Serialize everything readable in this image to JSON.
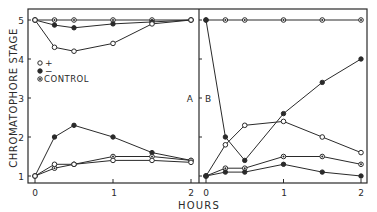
{
  "chart_data": [
    {
      "type": "line",
      "panel": "A",
      "title": "",
      "xlabel": "HOURS",
      "ylabel": "CHROMATOPHORE STAGE",
      "xlim": [
        0,
        2
      ],
      "ylim": [
        1,
        5
      ],
      "x_ticks": [
        "0",
        "1",
        "2"
      ],
      "y_ticks": [
        "1",
        "2",
        "3",
        "4",
        "5"
      ],
      "grid": false,
      "legend": {
        "position": "upper-left-inside",
        "entries": [
          {
            "marker": "open-circle",
            "label": "+"
          },
          {
            "marker": "filled-circle",
            "label": "−"
          },
          {
            "marker": "half-filled-circle",
            "label": "CONTROL"
          }
        ]
      },
      "x": [
        0,
        0.25,
        0.5,
        1,
        1.5,
        2
      ],
      "series": [
        {
          "name": "CONTROL (upper)",
          "marker": "half",
          "values": [
            5.0,
            5.0,
            5.0,
            5.0,
            5.0,
            5.0
          ]
        },
        {
          "name": "− (upper)",
          "marker": "filled",
          "values": [
            5.0,
            4.87,
            4.8,
            4.9,
            4.95,
            5.0
          ]
        },
        {
          "name": "+ (upper)",
          "marker": "open",
          "values": [
            5.0,
            4.3,
            4.2,
            4.4,
            4.9,
            5.0
          ]
        },
        {
          "name": "− (lower)",
          "marker": "filled",
          "values": [
            1.0,
            2.0,
            2.3,
            2.0,
            1.6,
            1.4
          ]
        },
        {
          "name": "CONTROL (lower)",
          "marker": "half",
          "values": [
            1.0,
            1.2,
            1.3,
            1.5,
            1.5,
            1.4
          ]
        },
        {
          "name": "+ (lower)",
          "marker": "open",
          "values": [
            1.0,
            1.3,
            1.3,
            1.4,
            1.4,
            1.35
          ]
        }
      ]
    },
    {
      "type": "line",
      "panel": "B",
      "title": "",
      "xlabel": "HOURS",
      "ylabel": "CHROMATOPHORE STAGE",
      "xlim": [
        0,
        2
      ],
      "ylim": [
        1,
        5
      ],
      "x_ticks": [
        "0",
        "1",
        "2"
      ],
      "grid": false,
      "x": [
        0,
        0.25,
        0.5,
        1,
        1.5,
        2
      ],
      "series": [
        {
          "name": "CONTROL (upper)",
          "marker": "half",
          "values": [
            5.0,
            5.0,
            5.0,
            5.0,
            5.0,
            5.0
          ]
        },
        {
          "name": "− (from 5)",
          "marker": "filled",
          "values": [
            5.0,
            2.0,
            1.4,
            2.6,
            3.4,
            4.0
          ]
        },
        {
          "name": "+ (from 1)",
          "marker": "open",
          "values": [
            1.0,
            1.8,
            2.3,
            2.4,
            2.0,
            1.6
          ]
        },
        {
          "name": "CONTROL (lower)",
          "marker": "half",
          "values": [
            1.0,
            1.2,
            1.2,
            1.5,
            1.5,
            1.3
          ]
        },
        {
          "name": "− (lower)",
          "marker": "filled",
          "values": [
            1.0,
            1.1,
            1.1,
            1.3,
            1.1,
            1.0
          ]
        }
      ]
    }
  ],
  "labels": {
    "ylabel": "CHROMATOPHORE STAGE",
    "xlabel": "HOURS",
    "panel_divider": "A│B",
    "panel_a": "A",
    "panel_b": "B",
    "legend_plus": "+",
    "legend_minus": "−",
    "legend_control": "CONTROL",
    "y_ticks": [
      "5",
      "4",
      "3",
      "2",
      "1"
    ],
    "x_ticks_a": [
      "0",
      "1",
      "2"
    ],
    "x_ticks_b": [
      "0",
      "1",
      "2"
    ]
  },
  "colors": {
    "ink": "#2a2a2a",
    "background": "#ffffff"
  }
}
